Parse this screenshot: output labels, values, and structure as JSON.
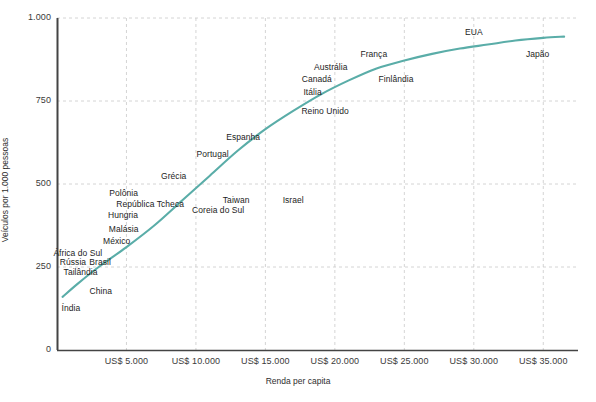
{
  "chart_data": {
    "type": "line",
    "title": "",
    "subtitle": "",
    "xlabel": "Renda per capita",
    "ylabel": "Veículos por 1.000 pessoas",
    "xlim": [
      0,
      37500
    ],
    "ylim": [
      0,
      1000
    ],
    "grid": true,
    "legend": "none",
    "line_color": "#5aada8",
    "xticks": [
      {
        "value": 5000,
        "label": "US$ 5.000"
      },
      {
        "value": 10000,
        "label": "US$ 10.000"
      },
      {
        "value": 15000,
        "label": "US$ 15.000"
      },
      {
        "value": 20000,
        "label": "US$ 20.000"
      },
      {
        "value": 25000,
        "label": "US$ 25.000"
      },
      {
        "value": 30000,
        "label": "US$ 30.000"
      },
      {
        "value": 35000,
        "label": "US$ 35.000"
      }
    ],
    "yticks": [
      {
        "value": 0,
        "label": "0"
      },
      {
        "value": 250,
        "label": "250"
      },
      {
        "value": 500,
        "label": "500"
      },
      {
        "value": 750,
        "label": "750"
      },
      {
        "value": 1000,
        "label": "1.000"
      }
    ],
    "series": [
      {
        "name": "Curva de motorização",
        "color": "#5aada8",
        "points": [
          {
            "x": 400,
            "y": 160
          },
          {
            "x": 1500,
            "y": 200
          },
          {
            "x": 3000,
            "y": 250
          },
          {
            "x": 5000,
            "y": 310
          },
          {
            "x": 7000,
            "y": 375
          },
          {
            "x": 9000,
            "y": 450
          },
          {
            "x": 11000,
            "y": 525
          },
          {
            "x": 13000,
            "y": 600
          },
          {
            "x": 15000,
            "y": 665
          },
          {
            "x": 17000,
            "y": 720
          },
          {
            "x": 19000,
            "y": 770
          },
          {
            "x": 21000,
            "y": 812
          },
          {
            "x": 23000,
            "y": 848
          },
          {
            "x": 25000,
            "y": 872
          },
          {
            "x": 27000,
            "y": 892
          },
          {
            "x": 29000,
            "y": 908
          },
          {
            "x": 31000,
            "y": 920
          },
          {
            "x": 33000,
            "y": 932
          },
          {
            "x": 35000,
            "y": 940
          },
          {
            "x": 36500,
            "y": 944
          }
        ]
      }
    ],
    "annotations": [
      {
        "label": "Índia",
        "x": 1000,
        "y": 125
      },
      {
        "label": "Tailândia",
        "x": 1700,
        "y": 232
      },
      {
        "label": "Rússia",
        "x": 1150,
        "y": 262
      },
      {
        "label": "África do Sul",
        "x": 1500,
        "y": 290
      },
      {
        "label": "Brasil",
        "x": 3100,
        "y": 262
      },
      {
        "label": "China",
        "x": 3150,
        "y": 175
      },
      {
        "label": "México",
        "x": 4300,
        "y": 325
      },
      {
        "label": "Malásia",
        "x": 4800,
        "y": 363
      },
      {
        "label": "Hungria",
        "x": 4750,
        "y": 405
      },
      {
        "label": "República Tcheca",
        "x": 6700,
        "y": 438
      },
      {
        "label": "Polônia",
        "x": 4800,
        "y": 470
      },
      {
        "label": "Grécia",
        "x": 8400,
        "y": 520
      },
      {
        "label": "Coreia do Sul",
        "x": 11600,
        "y": 420
      },
      {
        "label": "Taiwan",
        "x": 12900,
        "y": 448
      },
      {
        "label": "Israel",
        "x": 17000,
        "y": 448
      },
      {
        "label": "Portugal",
        "x": 11200,
        "y": 588
      },
      {
        "label": "Espanha",
        "x": 13400,
        "y": 640
      },
      {
        "label": "Reino Unido",
        "x": 19300,
        "y": 718
      },
      {
        "label": "Itália",
        "x": 18400,
        "y": 775
      },
      {
        "label": "Canadá",
        "x": 18700,
        "y": 812
      },
      {
        "label": "Austrália",
        "x": 19700,
        "y": 850
      },
      {
        "label": "França",
        "x": 22800,
        "y": 890
      },
      {
        "label": "Finlândia",
        "x": 24400,
        "y": 812
      },
      {
        "label": "EUA",
        "x": 30000,
        "y": 955
      },
      {
        "label": "Japão",
        "x": 34600,
        "y": 890
      }
    ]
  },
  "caption": ""
}
